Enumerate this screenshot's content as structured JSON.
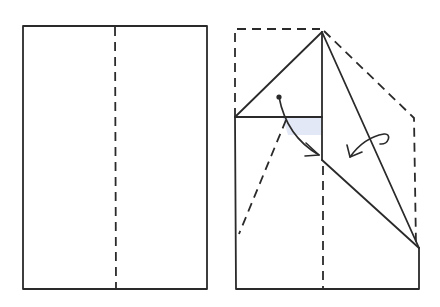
{
  "diagram": {
    "type": "origami-folding-steps",
    "colors": {
      "ink": "#2a2a2a",
      "background": "#ffffff",
      "shade": "#e3e8f6"
    },
    "steps": [
      {
        "id": "step-1",
        "description": "Rectangle sheet with vertical center valley-fold line",
        "outline": {
          "x": 23,
          "y": 26,
          "width": 184,
          "height": 263
        },
        "fold_lines": [
          {
            "style": "dashed",
            "from": [
              115,
              26
            ],
            "to": [
              115,
              289
            ]
          }
        ]
      },
      {
        "id": "step-2",
        "description": "Top corners folded to center; further folds indicated by arrows",
        "original_outline_dashed": true,
        "apex": [
          322,
          32
        ],
        "arrows": [
          {
            "name": "fold-in-arrow-left",
            "kind": "valley-fold"
          },
          {
            "name": "fold-behind-arrow-right",
            "kind": "turn-over-fold"
          }
        ],
        "marker_dot": [
          280,
          97
        ]
      }
    ]
  }
}
